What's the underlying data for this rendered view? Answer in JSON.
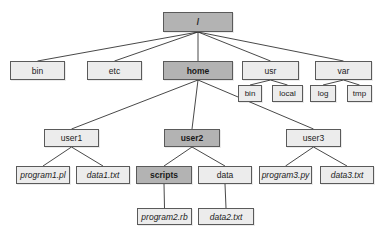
{
  "diagram": {
    "colors": {
      "highlight_fill": "#b3b3b3",
      "normal_fill": "#ececec",
      "border": "#5a5a5a",
      "edge": "#333333"
    },
    "nodes": {
      "root": {
        "label": "/",
        "x": 163,
        "y": 12,
        "w": 70,
        "h": 20,
        "type": "dir",
        "highlight": true
      },
      "bin": {
        "label": "bin",
        "x": 10,
        "y": 61,
        "w": 55,
        "h": 19,
        "type": "dir",
        "highlight": false
      },
      "etc": {
        "label": "etc",
        "x": 87,
        "y": 61,
        "w": 55,
        "h": 19,
        "type": "dir",
        "highlight": false
      },
      "home": {
        "label": "home",
        "x": 163,
        "y": 61,
        "w": 70,
        "h": 19,
        "type": "dir",
        "highlight": true
      },
      "usr": {
        "label": "usr",
        "x": 242,
        "y": 61,
        "w": 57,
        "h": 19,
        "type": "dir",
        "highlight": false
      },
      "var": {
        "label": "var",
        "x": 315,
        "y": 61,
        "w": 57,
        "h": 19,
        "type": "dir",
        "highlight": false
      },
      "usr_bin": {
        "label": "bin",
        "x": 238,
        "y": 85,
        "w": 24,
        "h": 17,
        "type": "dir",
        "highlight": false
      },
      "usr_local": {
        "label": "local",
        "x": 272,
        "y": 85,
        "w": 31,
        "h": 17,
        "type": "dir",
        "highlight": false
      },
      "var_log": {
        "label": "log",
        "x": 310,
        "y": 85,
        "w": 26,
        "h": 17,
        "type": "dir",
        "highlight": false
      },
      "var_tmp": {
        "label": "tmp",
        "x": 347,
        "y": 85,
        "w": 25,
        "h": 17,
        "type": "dir",
        "highlight": false
      },
      "user1": {
        "label": "user1",
        "x": 44,
        "y": 129,
        "w": 55,
        "h": 18,
        "type": "dir",
        "highlight": false
      },
      "user2": {
        "label": "user2",
        "x": 164,
        "y": 129,
        "w": 56,
        "h": 18,
        "type": "dir",
        "highlight": true
      },
      "user3": {
        "label": "user3",
        "x": 286,
        "y": 129,
        "w": 55,
        "h": 18,
        "type": "dir",
        "highlight": false
      },
      "program1_pl": {
        "label": "program1.pl",
        "x": 16,
        "y": 166,
        "w": 54,
        "h": 18,
        "type": "file",
        "highlight": false
      },
      "data1_txt": {
        "label": "data1.txt",
        "x": 76,
        "y": 166,
        "w": 54,
        "h": 18,
        "type": "file",
        "highlight": false
      },
      "scripts": {
        "label": "scripts",
        "x": 136,
        "y": 166,
        "w": 56,
        "h": 18,
        "type": "dir",
        "highlight": true
      },
      "data": {
        "label": "data",
        "x": 198,
        "y": 166,
        "w": 54,
        "h": 18,
        "type": "dir",
        "highlight": false
      },
      "program3_py": {
        "label": "program3.py",
        "x": 259,
        "y": 166,
        "w": 53,
        "h": 18,
        "type": "file",
        "highlight": false
      },
      "data3_txt": {
        "label": "data3.txt",
        "x": 320,
        "y": 166,
        "w": 54,
        "h": 18,
        "type": "file",
        "highlight": false
      },
      "program2_rb": {
        "label": "program2.rb",
        "x": 137,
        "y": 208,
        "w": 55,
        "h": 17,
        "type": "file",
        "highlight": false
      },
      "data2_txt": {
        "label": "data2.txt",
        "x": 198,
        "y": 208,
        "w": 56,
        "h": 17,
        "type": "file",
        "highlight": false
      }
    },
    "edges": [
      {
        "from": "root",
        "to": "bin"
      },
      {
        "from": "root",
        "to": "etc"
      },
      {
        "from": "root",
        "to": "home"
      },
      {
        "from": "root",
        "to": "usr"
      },
      {
        "from": "root",
        "to": "var"
      },
      {
        "from": "usr",
        "to": "usr_bin"
      },
      {
        "from": "usr",
        "to": "usr_local"
      },
      {
        "from": "var",
        "to": "var_log"
      },
      {
        "from": "var",
        "to": "var_tmp"
      },
      {
        "from": "home",
        "to": "user1"
      },
      {
        "from": "home",
        "to": "user2"
      },
      {
        "from": "home",
        "to": "user3"
      },
      {
        "from": "user1",
        "to": "program1_pl"
      },
      {
        "from": "user1",
        "to": "data1_txt"
      },
      {
        "from": "user2",
        "to": "scripts"
      },
      {
        "from": "user2",
        "to": "data"
      },
      {
        "from": "user3",
        "to": "program3_py"
      },
      {
        "from": "user3",
        "to": "data3_txt"
      },
      {
        "from": "scripts",
        "to": "program2_rb"
      },
      {
        "from": "data",
        "to": "data2_txt"
      }
    ]
  }
}
